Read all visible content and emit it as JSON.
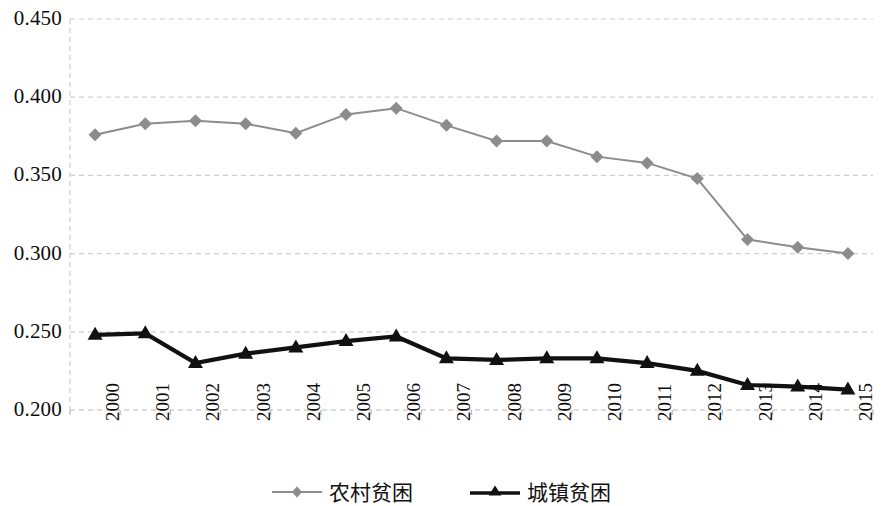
{
  "chart_data": {
    "type": "line",
    "title": "",
    "subtitle": "",
    "xlabel": "",
    "ylabel": "",
    "categories": [
      "2000",
      "2001",
      "2002",
      "2003",
      "2004",
      "2005",
      "2006",
      "2007",
      "2008",
      "2009",
      "2010",
      "2011",
      "2012",
      "2013",
      "2014",
      "2015"
    ],
    "x": [
      2000,
      2001,
      2002,
      2003,
      2004,
      2005,
      2006,
      2007,
      2008,
      2009,
      2010,
      2011,
      2012,
      2013,
      2014,
      2015
    ],
    "series": [
      {
        "name": "农村贫困",
        "color": "#8c8c8c",
        "marker": "diamond",
        "values": [
          0.376,
          0.383,
          0.385,
          0.383,
          0.377,
          0.389,
          0.393,
          0.382,
          0.372,
          0.372,
          0.362,
          0.358,
          0.348,
          0.309,
          0.304,
          0.3
        ]
      },
      {
        "name": "城镇贫困",
        "color": "#111111",
        "marker": "triangle",
        "values": [
          0.248,
          0.249,
          0.23,
          0.236,
          0.24,
          0.244,
          0.247,
          0.233,
          0.232,
          0.233,
          0.233,
          0.23,
          0.225,
          0.216,
          0.215,
          0.213
        ]
      }
    ],
    "ylim": [
      0.2,
      0.45
    ],
    "ytick_labels": [
      "0.200",
      "0.250",
      "0.300",
      "0.350",
      "0.400",
      "0.450"
    ],
    "ytick_values": [
      0.2,
      0.25,
      0.3,
      0.35,
      0.4,
      0.45
    ],
    "grid": true,
    "grid_style": "dashed",
    "grid_color": "#cfcfcf",
    "legend_position": "bottom"
  },
  "legend": {
    "entries": [
      {
        "label": "农村贫困",
        "marker": "diamond-marker-icon"
      },
      {
        "label": "城镇贫困",
        "marker": "triangle-marker-icon"
      }
    ]
  },
  "axes": {
    "y_labels": [
      "0.450",
      "0.400",
      "0.350",
      "0.300",
      "0.250",
      "0.200"
    ],
    "x_labels": [
      "2000",
      "2001",
      "2002",
      "2003",
      "2004",
      "2005",
      "2006",
      "2007",
      "2008",
      "2009",
      "2010",
      "2011",
      "2012",
      "2013",
      "2014",
      "2015"
    ]
  }
}
